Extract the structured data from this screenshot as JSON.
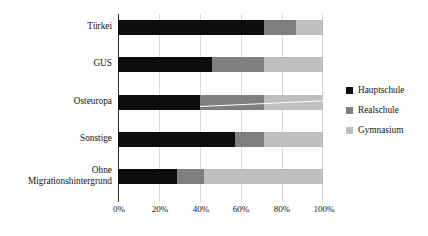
{
  "chart_data": {
    "type": "bar",
    "orientation": "horizontal",
    "stacked": true,
    "stack_mode": "percent",
    "title": "",
    "subtitle": "",
    "xlabel": "",
    "ylabel": "",
    "xlim": [
      0,
      100
    ],
    "grid": true,
    "grid_axis": "x",
    "legend_position": "right",
    "categories": [
      "Türkei",
      "GUS",
      "Osteuropa",
      "Sonstige",
      "Ohne Migrationshintergrund"
    ],
    "category_lines": [
      [
        "Türkei"
      ],
      [
        "GUS"
      ],
      [
        "Osteuropa"
      ],
      [
        "Sonstige"
      ],
      [
        "Ohne",
        "Migrationshintergrund"
      ]
    ],
    "xtick_labels": [
      "0%",
      "20%",
      "40%",
      "60%",
      "80%",
      "100%"
    ],
    "xtick_values": [
      0,
      20,
      40,
      60,
      80,
      100
    ],
    "series": [
      {
        "name": "Hauptschule",
        "color": "#0d0d0d",
        "values": [
          71,
          46,
          40,
          57,
          29
        ]
      },
      {
        "name": "Realschule",
        "color": "#7f7f7f",
        "values": [
          16,
          25,
          31,
          14,
          13
        ]
      },
      {
        "name": "Gymnasium",
        "color": "#bfbfbf",
        "values": [
          13,
          29,
          29,
          29,
          58
        ]
      }
    ],
    "legend_entries": [
      {
        "label": "Hauptschule",
        "color": "#0d0d0d"
      },
      {
        "label": "Realschule",
        "color": "#7f7f7f"
      },
      {
        "label": "Gymnasium",
        "color": "#bfbfbf"
      }
    ],
    "annotations": [
      {
        "type": "leader-line",
        "category": "Osteuropa",
        "color": "#ffffff"
      }
    ]
  },
  "colors": {
    "background": "#ffffff",
    "axis": "#2b2b2b",
    "gridline": "#d9d9d9",
    "text": "#111111",
    "hauptschule": "#0d0d0d",
    "realschule": "#7f7f7f",
    "gymnasium": "#bfbfbf"
  }
}
